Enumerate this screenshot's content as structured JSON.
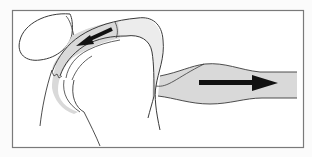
{
  "figure": {
    "type": "anatomical-illustration",
    "frame": {
      "stroke": "#7a7a7a",
      "fill": "#ffffff"
    },
    "colors": {
      "line": "#3a3a3a",
      "tissue_fill": "#d9d9d9",
      "light_fill": "#ececec",
      "arrow": "#111111"
    },
    "arrows": [
      {
        "name": "left-arrow",
        "direction": "left",
        "region": "upper curved sheath"
      },
      {
        "name": "right-arrow",
        "direction": "right",
        "region": "horizontal tube"
      }
    ]
  }
}
